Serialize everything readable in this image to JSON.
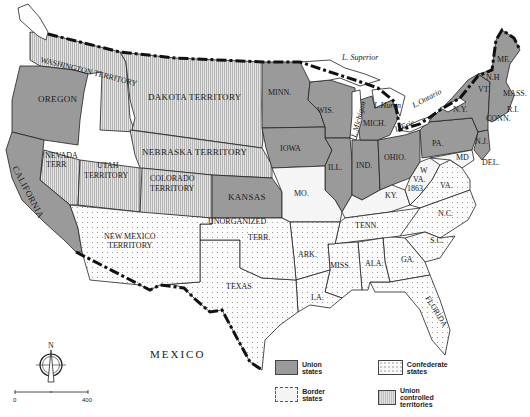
{
  "map": {
    "title": "",
    "colors": {
      "union": "#9a9a9a",
      "border": "#f4f4f4",
      "confederate": "#fafafa",
      "union_territory": "#d0d0d0",
      "line": "#222222"
    },
    "union_states": [
      "OREGON",
      "CALIFORNIA",
      "KANSAS",
      "MINN.",
      "WIS.",
      "IOWA",
      "ILL.",
      "IND.",
      "OHIO",
      "MICH.",
      "PA.",
      "N.Y.",
      "N.J.",
      "VT.",
      "N.H",
      "ME.",
      "MASS.",
      "R.I.",
      "CONN."
    ],
    "border_states": [
      "MO.",
      "KY.",
      "W VA. 1863",
      "MD",
      "DEL."
    ],
    "confederate_states": [
      "TEXAS",
      "ARK.",
      "LA.",
      "TENN.",
      "MISS.",
      "ALA.",
      "GA.",
      "S.C.",
      "N.C.",
      "VA.",
      "FLORIDA"
    ],
    "union_territories": [
      "WASHINGTON TERRITORY",
      "DAKOTA TERRITORY",
      "NEBRASKA TERRITORY",
      "NEVADA TERR",
      "UTAH TERRITORY",
      "COLORADO TERRITORY"
    ],
    "other_regions": [
      "NEW MEXICO TERRITORY",
      "UNORGANIZED TERR."
    ],
    "labels": {
      "oregon": "OREGON",
      "california": "CALIFORNIA",
      "washington": "WASHINGTON TERRITORY",
      "dakota": "DAKOTA TERRITORY",
      "nebraska": "NEBRASKA TERRITORY",
      "nevada_1": "NEVADA",
      "nevada_2": "TERR",
      "utah_1": "UTAH",
      "utah_2": "TERRITORY",
      "colorado_1": "COLORADO",
      "colorado_2": "TERRITORY",
      "kansas": "KANSAS",
      "newmexico_1": "NEW MEXICO",
      "newmexico_2": "TERRITORY",
      "unorganized_1": "UNORGANIZED",
      "unorganized_2": "TERR.",
      "texas": "TEXAS",
      "minn": "MINN.",
      "wis": "WIS.",
      "iowa": "IOWA",
      "ill": "ILL.",
      "ind": "IND.",
      "ohio": "OHIO.",
      "mich": "MICH.",
      "mo": "MO.",
      "ky": "KY.",
      "wva_1": "W",
      "wva_2": "VA.",
      "wva_3": "1863",
      "va": "VA.",
      "nc": "N.C.",
      "sc": "S.C.",
      "tenn": "TENN.",
      "ark": "ARK.",
      "la": "LA.",
      "miss": "MISS.",
      "ala": "ALA.",
      "ga": "GA.",
      "florida": "FLORIDA",
      "pa": "PA.",
      "ny": "N.Y.",
      "nj": "N.J.",
      "md": "MD",
      "del": "DEL.",
      "vt": "VT.",
      "nh": "N.H",
      "me": "ME.",
      "mass": "MASS.",
      "ri": "R.I.",
      "conn": "CONN.",
      "superior": "L. Superior",
      "michigan": "L.Michigan",
      "huron": "L.Huron",
      "erie": "L.Erie",
      "ontario": "L.Ontario",
      "mexico": "MEXICO"
    },
    "compass": {
      "label": "N"
    },
    "scale": {
      "start": "0",
      "end": "400"
    }
  },
  "legend": {
    "items": [
      {
        "key": "union",
        "label": "Union states"
      },
      {
        "key": "confederate",
        "label": "Confederate states"
      },
      {
        "key": "border",
        "label": "Border states"
      },
      {
        "key": "territory",
        "label": "Union controlled territories"
      }
    ]
  }
}
